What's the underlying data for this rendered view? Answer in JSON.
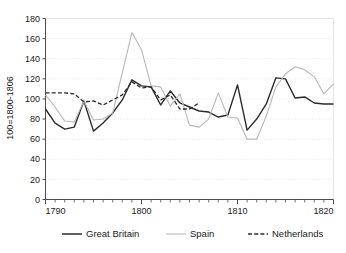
{
  "chart_data": {
    "type": "line",
    "title": "",
    "subtitle": "",
    "xlabel": "",
    "ylabel": "100=1800-1806",
    "xlim": [
      1790,
      1820
    ],
    "ylim": [
      0,
      180
    ],
    "ytick_step": 20,
    "xtick_step": 1,
    "xtick_labels": [
      "1790",
      "1800",
      "1810",
      "1820"
    ],
    "xtick_label_values": [
      1790,
      1800,
      1810,
      1820
    ],
    "ytick_labels": [
      "0",
      "20",
      "40",
      "60",
      "80",
      "100",
      "120",
      "140",
      "160",
      "180"
    ],
    "ytick_values": [
      0,
      20,
      40,
      60,
      80,
      100,
      120,
      140,
      160,
      180
    ],
    "grid": "horizontal-dotted",
    "legend_position": "bottom",
    "x": [
      1790,
      1791,
      1792,
      1793,
      1794,
      1795,
      1796,
      1797,
      1798,
      1799,
      1800,
      1801,
      1802,
      1803,
      1804,
      1805,
      1806,
      1807,
      1808,
      1809,
      1810,
      1811,
      1812,
      1813,
      1814,
      1815,
      1816,
      1817,
      1818,
      1819,
      1820
    ],
    "series": [
      {
        "name": "Great Britain",
        "color": "#2b2b2b",
        "style": "solid",
        "width": 1.4,
        "values": [
          90,
          76,
          70,
          72,
          98,
          68,
          76,
          86,
          99,
          119,
          113,
          112,
          94,
          108,
          96,
          92,
          88,
          87,
          82,
          84,
          114,
          69,
          80,
          95,
          121,
          120,
          101,
          102,
          96,
          95,
          95
        ]
      },
      {
        "name": "Spain",
        "color": "#b8b8b8",
        "style": "solid",
        "width": 1.1,
        "values": [
          104,
          92,
          78,
          77,
          98,
          79,
          80,
          86,
          126,
          166,
          149,
          113,
          112,
          93,
          105,
          74,
          72,
          80,
          106,
          82,
          81,
          60,
          60,
          83,
          112,
          125,
          132,
          129,
          122,
          105,
          115
        ]
      },
      {
        "name": "Netherlands",
        "color": "#2b2b2b",
        "style": "dashed",
        "width": 1.3,
        "values": [
          106,
          106,
          106,
          105,
          97,
          98,
          94,
          99,
          104,
          117,
          111,
          112,
          99,
          104,
          90,
          90,
          96,
          null,
          null,
          null,
          null,
          null,
          null,
          null,
          null,
          null,
          null,
          null,
          null,
          null,
          null
        ]
      }
    ]
  },
  "legend": {
    "items": [
      {
        "label": "Great Britain",
        "color": "#2b2b2b",
        "style": "solid"
      },
      {
        "label": "Spain",
        "color": "#b8b8b8",
        "style": "solid"
      },
      {
        "label": "Netherlands",
        "color": "#2b2b2b",
        "style": "dashed"
      }
    ]
  },
  "colors": {
    "axis": "#4d4d4d",
    "grid": "#d9d9d9",
    "text": "#1a1a1a",
    "background": "#ffffff"
  }
}
